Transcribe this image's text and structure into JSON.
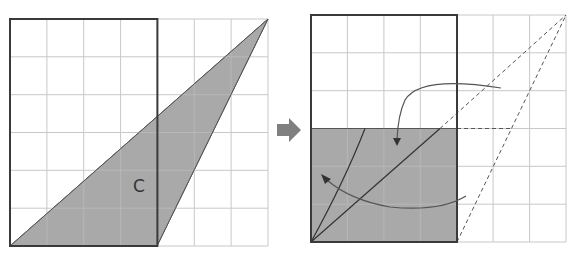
{
  "diagram": {
    "colors": {
      "shade": "#a9a9a9",
      "grid": "#c8c8c8",
      "outline": "#3a3a3a",
      "arrow": "#808080"
    },
    "left_panel": {
      "grid": {
        "cols": 7,
        "rows": 6
      },
      "outlined_rectangle": {
        "cols": 4,
        "rows": 6
      },
      "shaded_shape": "triangle",
      "triangle_vertices_grid": [
        [
          0,
          0
        ],
        [
          4,
          0
        ],
        [
          7,
          6
        ]
      ],
      "label": "C"
    },
    "transform_arrow": {
      "icon": "right-arrow-icon"
    },
    "right_panel": {
      "grid": {
        "cols": 7,
        "rows": 6
      },
      "outlined_rectangle": {
        "cols": 4,
        "rows": 6
      },
      "shaded_region": {
        "cols": 4,
        "rows": 3
      },
      "dashed_triangle_vertices_grid": [
        [
          4,
          0
        ],
        [
          7,
          6
        ],
        [
          4,
          3
        ]
      ],
      "curved_arrows": 2
    }
  }
}
